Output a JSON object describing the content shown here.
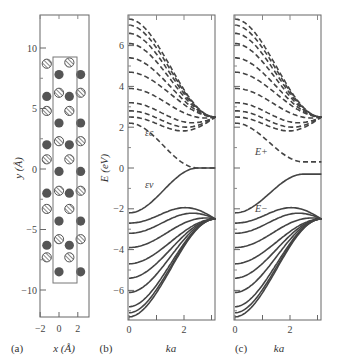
{
  "figure": {
    "panels": [
      {
        "id": "a",
        "label": "(a)",
        "xlabel": "x (Å)",
        "ylabel": "y (Å)",
        "xticks": [
          "−2",
          "0",
          "2"
        ],
        "yticks": [
          "10",
          "5",
          "0",
          "−5",
          "−10"
        ]
      },
      {
        "id": "b",
        "label": "(b)",
        "xlabel": "ka",
        "ylabel": "E (eV)",
        "xticks": [
          "0",
          "2"
        ],
        "yticks": [
          "6",
          "4",
          "2",
          "0",
          "−2",
          "−4",
          "−6"
        ],
        "band_labels": {
          "conduction": "εc",
          "valence": "εv"
        }
      },
      {
        "id": "c",
        "label": "(c)",
        "xlabel": "ka",
        "xticks": [
          "0",
          "2"
        ],
        "band_labels": {
          "upper": "E+",
          "lower": "E−"
        }
      }
    ]
  },
  "chart_data": [
    {
      "type": "scatter",
      "panel": "(a)",
      "title": "Atomic structure of nanoribbon unit cell",
      "xlabel": "x (Å)",
      "ylabel": "y (Å)",
      "xlim": [
        -2.0,
        3.2
      ],
      "ylim": [
        -12.3,
        12.6
      ],
      "unit_cell": {
        "x": [
          -0.6,
          1.9
        ],
        "y": [
          -9.4,
          9.2
        ]
      },
      "series": [
        {
          "name": "hatched atoms",
          "points": [
            [
              -1.3,
              8.7
            ],
            [
              1.1,
              8.8
            ],
            [
              0,
              6.3
            ],
            [
              2.3,
              6.3
            ],
            [
              -1.3,
              4.8
            ],
            [
              1.1,
              4.8
            ],
            [
              0,
              2.3
            ],
            [
              2.3,
              2.3
            ],
            [
              -1.3,
              0.8
            ],
            [
              1.1,
              0.8
            ],
            [
              0,
              -1.8
            ],
            [
              2.3,
              -1.8
            ],
            [
              -1.3,
              -3.3
            ],
            [
              1.1,
              -3.3
            ],
            [
              0,
              -5.8
            ],
            [
              2.3,
              -5.8
            ],
            [
              -1.3,
              -7.3
            ],
            [
              1.1,
              -7.3
            ]
          ]
        },
        {
          "name": "solid atoms",
          "points": [
            [
              0,
              7.8
            ],
            [
              2.3,
              7.8
            ],
            [
              -1.3,
              6.0
            ],
            [
              1.1,
              6.0
            ],
            [
              0,
              3.8
            ],
            [
              2.3,
              3.8
            ],
            [
              -1.3,
              2.0
            ],
            [
              1.1,
              2.0
            ],
            [
              0,
              -0.2
            ],
            [
              2.3,
              -0.2
            ],
            [
              -1.3,
              -2.0
            ],
            [
              1.1,
              -2.0
            ],
            [
              0,
              -4.3
            ],
            [
              2.3,
              -4.3
            ],
            [
              -1.3,
              -6.3
            ],
            [
              1.1,
              -6.3
            ],
            [
              0,
              -8.5
            ],
            [
              2.3,
              -8.5
            ]
          ]
        }
      ]
    },
    {
      "type": "line",
      "panel": "(b)",
      "xlabel": "ka",
      "ylabel": "E (eV)",
      "xlim": [
        0,
        3.14
      ],
      "ylim": [
        -7.5,
        7.5
      ],
      "series": [
        {
          "name": "conduction bands (dashed)",
          "E_at_0": [
            7.3,
            7.0,
            6.6,
            6.1,
            5.4,
            4.7,
            3.9,
            3.2,
            2.8,
            2.5
          ],
          "E_at_pi": 2.5
        },
        {
          "name": "lowest conduction band (dashed)",
          "E_at_0": 2.2,
          "E_at_pi": 0.0
        },
        {
          "name": "highest valence band (solid)",
          "E_at_0": -2.2,
          "E_at_pi": 0.0
        },
        {
          "name": "valence bands (solid)",
          "E_at_0": [
            -2.7,
            -3.2,
            -3.9,
            -4.7,
            -5.4,
            -6.1,
            -6.8,
            -7.1,
            -7.3
          ],
          "E_at_pi": -2.5
        }
      ],
      "annotations": [
        "εc",
        "εv"
      ]
    },
    {
      "type": "line",
      "panel": "(c)",
      "xlabel": "ka",
      "xlim": [
        0,
        3.14
      ],
      "ylim": [
        -7.5,
        7.5
      ],
      "series": [
        {
          "name": "E+ bands (dashed)",
          "E_at_0": [
            7.3,
            7.0,
            6.6,
            6.1,
            5.4,
            4.7,
            3.9,
            3.2,
            2.8,
            2.5
          ],
          "E_at_pi": 2.5
        },
        {
          "name": "lowest E+ band (dashed)",
          "E_at_0": 2.2,
          "E_at_pi": 0.3
        },
        {
          "name": "highest E− band (solid)",
          "E_at_0": -2.2,
          "E_at_pi": -0.3
        },
        {
          "name": "E− bands (solid)",
          "E_at_0": [
            -2.7,
            -3.2,
            -3.9,
            -4.7,
            -5.4,
            -6.1,
            -6.8,
            -7.1,
            -7.3
          ],
          "E_at_pi": -2.5
        }
      ],
      "annotations": [
        "E+",
        "E−"
      ]
    }
  ]
}
